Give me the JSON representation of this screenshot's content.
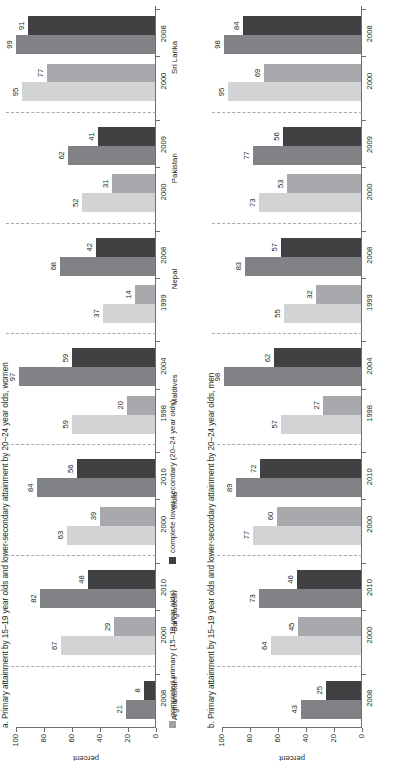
{
  "figure": {
    "axis_label": "percent",
    "y_ticks": [
      "0",
      "20",
      "40",
      "60",
      "80",
      "100"
    ],
    "legend": [
      {
        "key": "primary",
        "label": "completed primary (15–19 year olds)",
        "color": "#9d9fa2"
      },
      {
        "key": "lower_secondary",
        "label": "complete lower secondary (20–24 year olds)",
        "color": "#3f3f41"
      }
    ],
    "colors": {
      "primary_early": "#d2d3d5",
      "secondary_early": "#a7a9ac",
      "primary_late": "#808285",
      "secondary_late": "#414042",
      "axis": "#6d6e71",
      "separator": "#a7a9ac"
    }
  },
  "chart_data": [
    {
      "type": "bar",
      "panel": "a",
      "title": "a. Primary attainment by 15–19 year olds and lower-secondary attainment by 20–24 year olds, women",
      "xlabel": "",
      "ylabel": "percent",
      "ylim": [
        0,
        100
      ],
      "grid": false,
      "legend_position": "bottom",
      "categories": [
        "Afghanistan",
        "Bangladesh",
        "India",
        "Maldives",
        "Nepal",
        "Pakistan",
        "Sri Lanka"
      ],
      "groups": [
        {
          "country": "Afghanistan",
          "country_label": "Afghanistanᵃ",
          "years": [
            {
              "year": "2008",
              "period": "late",
              "primary": 21,
              "lower_secondary": 8
            }
          ]
        },
        {
          "country": "Bangladesh",
          "country_label": "Bangladesh",
          "years": [
            {
              "year": "2000",
              "period": "early",
              "primary": 67,
              "lower_secondary": 29
            },
            {
              "year": "2010",
              "period": "late",
              "primary": 82,
              "lower_secondary": 48
            }
          ]
        },
        {
          "country": "India",
          "country_label": "India",
          "years": [
            {
              "year": "2000",
              "period": "early",
              "primary": 63,
              "lower_secondary": 39
            },
            {
              "year": "2010",
              "period": "late",
              "primary": 84,
              "lower_secondary": 56
            }
          ]
        },
        {
          "country": "Maldives",
          "country_label": "Maldives",
          "years": [
            {
              "year": "1998",
              "period": "early",
              "primary": 59,
              "lower_secondary": 20
            },
            {
              "year": "2004",
              "period": "late",
              "primary": 97,
              "lower_secondary": 59
            }
          ]
        },
        {
          "country": "Nepal",
          "country_label": "Nepal",
          "years": [
            {
              "year": "1999",
              "period": "early",
              "primary": 37,
              "lower_secondary": 14
            },
            {
              "year": "2008",
              "period": "late",
              "primary": 68,
              "lower_secondary": 42
            }
          ]
        },
        {
          "country": "Pakistan",
          "country_label": "Pakistan",
          "years": [
            {
              "year": "2000",
              "period": "early",
              "primary": 52,
              "lower_secondary": 31
            },
            {
              "year": "2009",
              "period": "late",
              "primary": 62,
              "lower_secondary": 41
            }
          ]
        },
        {
          "country": "Sri Lanka",
          "country_label": "Sri Lanka",
          "years": [
            {
              "year": "2000",
              "period": "early",
              "primary": 95,
              "lower_secondary": 77
            },
            {
              "year": "2008",
              "period": "late",
              "primary": 99,
              "lower_secondary": 91
            }
          ]
        }
      ]
    },
    {
      "type": "bar",
      "panel": "b",
      "title": "b. Primary attainment by 15–19 year olds and lower-secondary attainment by 20–24 year olds, men",
      "xlabel": "",
      "ylabel": "percent",
      "ylim": [
        0,
        100
      ],
      "grid": false,
      "legend_position": "none",
      "categories": [
        "Afghanistan",
        "Bangladesh",
        "India",
        "Maldives",
        "Nepal",
        "Pakistan",
        "Sri Lanka"
      ],
      "groups": [
        {
          "country": "Afghanistan",
          "country_label": "",
          "years": [
            {
              "year": "2008",
              "period": "late",
              "primary": 43,
              "lower_secondary": 25
            }
          ]
        },
        {
          "country": "Bangladesh",
          "country_label": "",
          "years": [
            {
              "year": "2000",
              "period": "early",
              "primary": 64,
              "lower_secondary": 45
            },
            {
              "year": "2010",
              "period": "late",
              "primary": 73,
              "lower_secondary": 46
            }
          ]
        },
        {
          "country": "India",
          "country_label": "",
          "years": [
            {
              "year": "2000",
              "period": "early",
              "primary": 77,
              "lower_secondary": 60
            },
            {
              "year": "2010",
              "period": "late",
              "primary": 89,
              "lower_secondary": 72
            }
          ]
        },
        {
          "country": "Maldives",
          "country_label": "",
          "years": [
            {
              "year": "1998",
              "period": "early",
              "primary": 57,
              "lower_secondary": 27
            },
            {
              "year": "2004",
              "period": "late",
              "primary": 98,
              "lower_secondary": 62
            }
          ]
        },
        {
          "country": "Nepal",
          "country_label": "",
          "years": [
            {
              "year": "1999",
              "period": "early",
              "primary": 55,
              "lower_secondary": 32
            },
            {
              "year": "2008",
              "period": "late",
              "primary": 83,
              "lower_secondary": 57
            }
          ]
        },
        {
          "country": "Pakistan",
          "country_label": "",
          "years": [
            {
              "year": "2000",
              "period": "early",
              "primary": 73,
              "lower_secondary": 53
            },
            {
              "year": "2009",
              "period": "late",
              "primary": 77,
              "lower_secondary": 56
            }
          ]
        },
        {
          "country": "Sri Lanka",
          "country_label": "",
          "years": [
            {
              "year": "2000",
              "period": "early",
              "primary": 95,
              "lower_secondary": 69
            },
            {
              "year": "2008",
              "period": "late",
              "primary": 98,
              "lower_secondary": 84
            }
          ]
        }
      ]
    }
  ]
}
